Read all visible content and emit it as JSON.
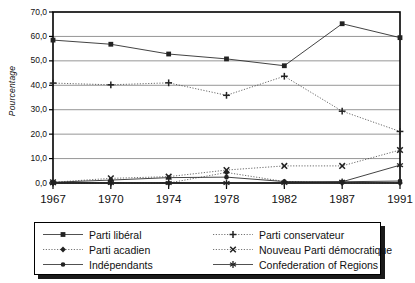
{
  "chart_data": {
    "type": "line",
    "title": "",
    "xlabel": "",
    "ylabel": "Pourcentage",
    "categories": [
      "1967",
      "1970",
      "1974",
      "1978",
      "1982",
      "1987",
      "1991"
    ],
    "ylim": [
      0,
      70
    ],
    "ytick_labels": [
      "0,0",
      "10,0",
      "20,0",
      "30,0",
      "40,0",
      "50,0",
      "60,0",
      "70,0"
    ],
    "ytick_values": [
      0,
      10,
      20,
      30,
      40,
      50,
      60,
      70
    ],
    "grid": "horizontal",
    "legend_position": "below-plot",
    "series": [
      {
        "name": "Parti libéral",
        "marker": "square",
        "line": "solid",
        "color": "#222222",
        "values": [
          58.5,
          56.8,
          52.8,
          50.8,
          48.0,
          65.2,
          59.5
        ]
      },
      {
        "name": "Parti conservateur",
        "marker": "plus",
        "line": "dotted",
        "color": "#222222",
        "values": [
          40.9,
          40.2,
          41.0,
          35.9,
          43.7,
          29.4,
          21.1
        ]
      },
      {
        "name": "Parti acadien",
        "marker": "diamond",
        "line": "dotted",
        "color": "#222222",
        "values": [
          0.0,
          0.0,
          0.0,
          4.3,
          0.6,
          0.0,
          0.0
        ]
      },
      {
        "name": "Nouveau Parti démocratique",
        "marker": "x",
        "line": "dotted",
        "color": "#222222",
        "values": [
          0.3,
          1.9,
          2.6,
          5.3,
          7.0,
          7.0,
          13.5
        ]
      },
      {
        "name": "Indépendants",
        "marker": "circle",
        "line": "solid",
        "color": "#222222",
        "values": [
          0.3,
          1.2,
          2.2,
          2.4,
          0.6,
          0.5,
          0.8
        ]
      },
      {
        "name": "Confederation of Regions",
        "marker": "star",
        "line": "solid",
        "color": "#222222",
        "values": [
          0.0,
          0.0,
          0.0,
          0.0,
          0.0,
          0.5,
          7.3
        ]
      }
    ]
  },
  "axis": {
    "y_title": "Pourcentage",
    "y_ticks": [
      "70,0",
      "60,0",
      "50,0",
      "40,0",
      "30,0",
      "20,0",
      "10,0",
      "0,0"
    ],
    "x_ticks": [
      "1967",
      "1970",
      "1974",
      "1978",
      "1982",
      "1987",
      "1991"
    ]
  },
  "legend": {
    "left_column": [
      {
        "label": "Parti libéral",
        "marker": "square-marker-icon",
        "line": "solid"
      },
      {
        "label": "Parti acadien",
        "marker": "diamond-marker-icon",
        "line": "dotted"
      },
      {
        "label": "Indépendants",
        "marker": "circle-marker-icon",
        "line": "solid"
      }
    ],
    "right_column": [
      {
        "label": "Parti conservateur",
        "marker": "plus-marker-icon",
        "line": "dotted"
      },
      {
        "label": "Nouveau Parti démocratique",
        "marker": "x-marker-icon",
        "line": "dotted"
      },
      {
        "label": "Confederation of Regions",
        "marker": "star-marker-icon",
        "line": "solid"
      }
    ]
  },
  "colors": {
    "ink": "#222222",
    "grid": "#8a8a8a",
    "axis": "#000000",
    "background": "#ffffff"
  }
}
